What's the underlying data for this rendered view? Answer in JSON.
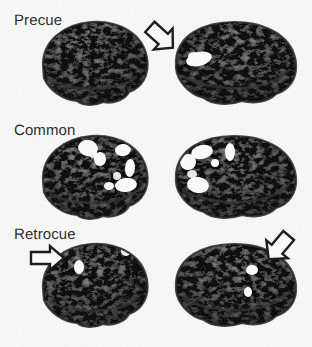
{
  "figure": {
    "background_color": "#fbfbfa",
    "label_color": "#1e1e1e",
    "activation_color": "#ffffff",
    "brain_base_color": "#6e6e6e",
    "arrow_outline_color": "#111111",
    "arrow_fill_color": "#ffffff",
    "width": 312,
    "height": 347
  },
  "rows": [
    {
      "label": "Precue",
      "label_x": 14,
      "label_y": 12,
      "brain_y": 14,
      "hemispheres": [
        {
          "side": "left-view",
          "x": 33,
          "y": 14,
          "width": 118,
          "height": 98,
          "activations": []
        },
        {
          "side": "right-view",
          "x": 168,
          "y": 14,
          "width": 134,
          "height": 98,
          "activations": [
            {
              "cx": 31,
              "cy": 45,
              "rx": 13,
              "ry": 7,
              "rot": -14,
              "name": "frontal-cluster"
            }
          ]
        }
      ],
      "arrows": [
        {
          "x": 140,
          "y": 16,
          "size": 38,
          "rotation": 42,
          "name": "precue-arrow"
        }
      ]
    },
    {
      "label": "Common",
      "label_x": 14,
      "label_y": 122,
      "brain_y": 128,
      "hemispheres": [
        {
          "side": "left-view",
          "x": 33,
          "y": 128,
          "width": 118,
          "height": 98,
          "activations": [
            {
              "cx": 55,
              "cy": 20,
              "rx": 10,
              "ry": 8,
              "rot": 10,
              "name": "superior-parietal-cluster"
            },
            {
              "cx": 67,
              "cy": 31,
              "rx": 6,
              "ry": 7,
              "rot": 0,
              "name": "parietal-cluster"
            },
            {
              "cx": 90,
              "cy": 22,
              "rx": 8,
              "ry": 6,
              "rot": -8,
              "name": "posterior-parietal-cluster"
            },
            {
              "cx": 97,
              "cy": 40,
              "rx": 5,
              "ry": 9,
              "rot": 5,
              "name": "occipito-parietal-cluster"
            },
            {
              "cx": 93,
              "cy": 57,
              "rx": 11,
              "ry": 7,
              "rot": -6,
              "name": "occipital-cluster"
            },
            {
              "cx": 76,
              "cy": 58,
              "rx": 5,
              "ry": 4,
              "rot": 0,
              "name": "temporal-cluster"
            }
          ]
        },
        {
          "side": "right-view",
          "x": 168,
          "y": 128,
          "width": 134,
          "height": 98,
          "activations": [
            {
              "cx": 20,
              "cy": 34,
              "rx": 8,
              "ry": 8,
              "rot": 0,
              "name": "frontal-cluster"
            },
            {
              "cx": 34,
              "cy": 24,
              "rx": 11,
              "ry": 7,
              "rot": -12,
              "name": "superior-frontal-cluster"
            },
            {
              "cx": 30,
              "cy": 57,
              "rx": 11,
              "ry": 8,
              "rot": 8,
              "name": "inferior-frontal-cluster"
            },
            {
              "cx": 62,
              "cy": 24,
              "rx": 5,
              "ry": 9,
              "rot": 0,
              "name": "precentral-cluster"
            },
            {
              "cx": 47,
              "cy": 35,
              "rx": 4,
              "ry": 4,
              "rot": 0,
              "name": "mid-frontal-cluster"
            }
          ]
        }
      ],
      "arrows": []
    },
    {
      "label": "Retrocue",
      "label_x": 14,
      "label_y": 226,
      "brain_y": 236,
      "hemispheres": [
        {
          "side": "left-view",
          "x": 33,
          "y": 236,
          "width": 118,
          "height": 98,
          "activations": [
            {
              "cx": 46,
              "cy": 31,
              "rx": 5,
              "ry": 7,
              "rot": 0,
              "name": "precentral-cluster"
            },
            {
              "cx": 93,
              "cy": 15,
              "rx": 5,
              "ry": 5,
              "rot": 0,
              "name": "parietal-cluster"
            }
          ]
        },
        {
          "side": "right-view",
          "x": 168,
          "y": 236,
          "width": 134,
          "height": 98,
          "activations": [
            {
              "cx": 23,
              "cy": 14,
              "rx": 4,
              "ry": 6,
              "rot": 0,
              "name": "superior-frontal-cluster"
            },
            {
              "cx": 84,
              "cy": 34,
              "rx": 6,
              "ry": 5,
              "rot": 0,
              "name": "occipital-cluster"
            },
            {
              "cx": 80,
              "cy": 56,
              "rx": 4,
              "ry": 5,
              "rot": 0,
              "name": "inferior-occipital-cluster"
            }
          ]
        }
      ],
      "arrows": [
        {
          "x": 28,
          "y": 243,
          "size": 34,
          "rotation": 0,
          "name": "retrocue-left-arrow"
        },
        {
          "x": 258,
          "y": 226,
          "size": 38,
          "rotation": 130,
          "name": "retrocue-right-arrow"
        }
      ]
    }
  ]
}
